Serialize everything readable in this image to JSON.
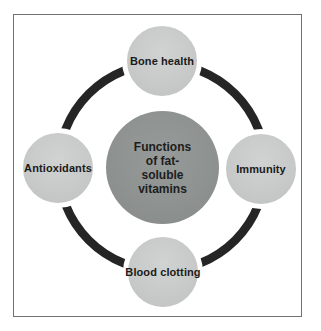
{
  "figure": {
    "center": {
      "label": "Functions of fat-soluble vitamins",
      "lines": [
        "Functions",
        "of fat-",
        "soluble",
        "vitamins"
      ]
    },
    "nodes": [
      {
        "position": "top",
        "label": "Bone health"
      },
      {
        "position": "right",
        "label": "Immunity"
      },
      {
        "position": "bottom",
        "label": "Blood clotting"
      },
      {
        "position": "left",
        "label": "Antioxidants"
      }
    ],
    "colors": {
      "background": "#ffffff",
      "frame_border": "#717171",
      "ring": "#252525",
      "node_fill": "#c8cac9",
      "center_fill": "#8e9290",
      "text": "#1a1a1a"
    }
  }
}
